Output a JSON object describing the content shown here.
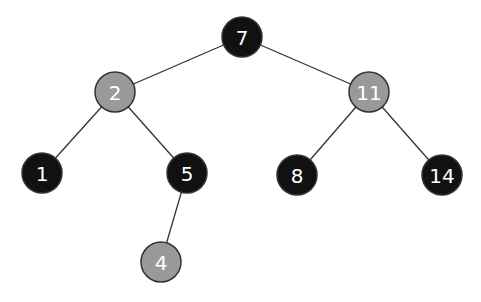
{
  "diagram": {
    "type": "red-black-tree",
    "colors": {
      "black": "#111111",
      "red": "#999999",
      "edge": "#333333",
      "label": "#ffffff",
      "outline": "#333333"
    },
    "nodes": [
      {
        "id": "n7",
        "label": "7",
        "color": "black",
        "x": 242,
        "y": 37
      },
      {
        "id": "n2",
        "label": "2",
        "color": "red",
        "x": 115,
        "y": 92
      },
      {
        "id": "n11",
        "label": "11",
        "color": "red",
        "x": 369,
        "y": 92
      },
      {
        "id": "n1",
        "label": "1",
        "color": "black",
        "x": 42,
        "y": 173
      },
      {
        "id": "n5",
        "label": "5",
        "color": "black",
        "x": 187,
        "y": 173
      },
      {
        "id": "n8",
        "label": "8",
        "color": "black",
        "x": 297,
        "y": 175
      },
      {
        "id": "n14",
        "label": "14",
        "color": "black",
        "x": 442,
        "y": 175
      },
      {
        "id": "n4",
        "label": "4",
        "color": "red",
        "x": 161,
        "y": 262
      }
    ],
    "edges": [
      {
        "from": "n7",
        "to": "n2"
      },
      {
        "from": "n7",
        "to": "n11"
      },
      {
        "from": "n2",
        "to": "n1"
      },
      {
        "from": "n2",
        "to": "n5"
      },
      {
        "from": "n11",
        "to": "n8"
      },
      {
        "from": "n11",
        "to": "n14"
      },
      {
        "from": "n5",
        "to": "n4"
      }
    ],
    "radius": 20
  }
}
